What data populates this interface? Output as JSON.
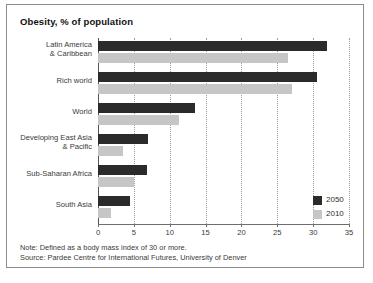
{
  "chart_data": {
    "type": "bar",
    "orientation": "horizontal",
    "title": "Obesity, % of population",
    "xlabel": "",
    "ylabel": "",
    "xlim": [
      0,
      35
    ],
    "xticks": [
      0,
      5,
      10,
      15,
      20,
      25,
      30,
      35
    ],
    "grid": true,
    "grid_style": "dotted vertical",
    "legend_position": "bottom-right",
    "categories": [
      "Latin America\n& Caribbean",
      "Rich world",
      "World",
      "Developing East Asia\n& Pacific",
      "Sub-Saharan Africa",
      "South Asia"
    ],
    "category_lines": [
      [
        "Latin America",
        "& Caribbean"
      ],
      [
        "Rich world"
      ],
      [
        "World"
      ],
      [
        "Developing East Asia",
        "& Pacific"
      ],
      [
        "Sub-Saharan Africa"
      ],
      [
        "South Asia"
      ]
    ],
    "series": [
      {
        "name": "2050",
        "color": "#2b2b2b",
        "values": [
          32.0,
          30.5,
          13.5,
          7.0,
          6.8,
          4.5
        ]
      },
      {
        "name": "2010",
        "color": "#c6c6c6",
        "values": [
          26.5,
          27.0,
          11.3,
          3.5,
          5.0,
          1.8
        ]
      }
    ]
  },
  "footnotes": {
    "note": "Note: Defined as a body mass index of 30 or more.",
    "source": "Source: Pardee Centre for International Futures, University of Denver"
  },
  "colors": {
    "series_2050": "#2b2b2b",
    "series_2010": "#c6c6c6",
    "border": "#8c8c8c",
    "grid": "#9a9a9a",
    "text": "#3a3a3a"
  }
}
